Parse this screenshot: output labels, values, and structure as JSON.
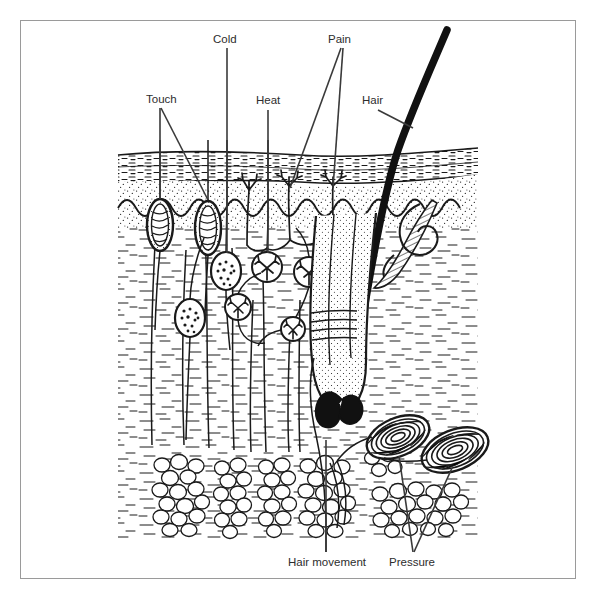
{
  "figure": {
    "frame_color": "#9a9a9a",
    "ink_color": "#1a1a1a",
    "label_color": "#2d2d2d",
    "background": "#ffffff"
  },
  "labels": {
    "touch": "Touch",
    "cold": "Cold",
    "heat": "Heat",
    "pain": "Pain",
    "hair": "Hair",
    "hair_movement": "Hair movement",
    "pressure": "Pressure"
  },
  "layers": [
    {
      "name": "epidermis",
      "texture": "horizontal-dashes"
    },
    {
      "name": "dermis-papillary",
      "texture": "fine-stipple"
    },
    {
      "name": "dermis-reticular",
      "texture": "short-dashes"
    },
    {
      "name": "subcutaneous-fat",
      "texture": "round-cells"
    }
  ],
  "structures": [
    {
      "name": "meissner-corpuscle",
      "label_ref": "touch",
      "count": 2
    },
    {
      "name": "krause-end-bulb",
      "label_ref": "cold",
      "count": 2
    },
    {
      "name": "ruffini-corpuscle",
      "label_ref": "heat",
      "count": 3
    },
    {
      "name": "free-nerve-ending",
      "label_ref": "pain",
      "count": 3
    },
    {
      "name": "hair-shaft",
      "label_ref": "hair",
      "count": 1
    },
    {
      "name": "hair-follicle-plexus",
      "label_ref": "hair_movement",
      "count": 1
    },
    {
      "name": "pacinian-corpuscle",
      "label_ref": "pressure",
      "count": 2
    },
    {
      "name": "arrector-pili-muscle",
      "label_ref": null,
      "count": 1
    },
    {
      "name": "sweat-gland-duct",
      "label_ref": null,
      "count": 1
    }
  ]
}
